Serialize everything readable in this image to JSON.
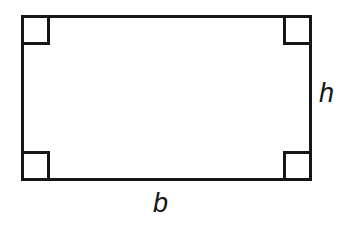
{
  "figure": {
    "kind": "geometry-diagram",
    "shape_name": "rectangle",
    "background_color": "#ffffff",
    "stroke_color": "#161616",
    "stroke_width": 2.6,
    "canvas": {
      "width": 344,
      "height": 231
    },
    "rectangle": {
      "x": 21,
      "y": 15,
      "width": 291,
      "height": 166
    },
    "right_angle_markers": {
      "count": 4,
      "size": 28,
      "corners": [
        "top-left",
        "top-right",
        "bottom-left",
        "bottom-right"
      ]
    },
    "labels": {
      "height": {
        "text": "h",
        "meaning": "height",
        "position": "right-side-outside",
        "style": "italic"
      },
      "base": {
        "text": "b",
        "meaning": "base",
        "position": "bottom-center-outside",
        "style": "italic"
      }
    }
  }
}
